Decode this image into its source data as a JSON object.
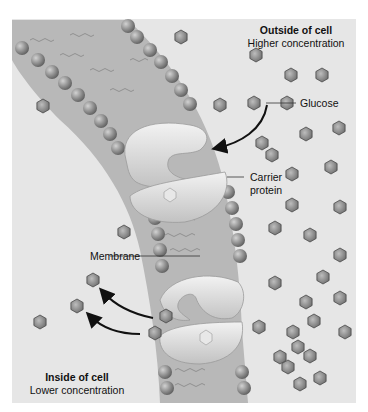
{
  "diagram": {
    "type": "facilitated-diffusion"
  },
  "regions": {
    "outside": {
      "title": "Outside of cell",
      "subtitle": "Higher concentration"
    },
    "inside": {
      "title": "Inside of cell",
      "subtitle": "Lower concentration"
    }
  },
  "labels": {
    "glucose": "Glucose",
    "carrier_protein_line1": "Carrier",
    "carrier_protein_line2": "protein",
    "membrane": "Membrane"
  },
  "colors": {
    "background": "#e6e6e6",
    "membrane_band": "#b8b8b8",
    "phospholipid_head": "#8a8a8a",
    "protein": "#d9d9d9",
    "glucose": "#7d7d7d",
    "arrow": "#111111"
  },
  "glucose_positions_outside": [
    [
      181,
      37
    ],
    [
      256,
      55
    ],
    [
      291,
      75
    ],
    [
      322,
      75
    ],
    [
      254,
      103
    ],
    [
      287,
      103
    ],
    [
      220,
      105
    ],
    [
      339,
      128
    ],
    [
      306,
      134
    ],
    [
      262,
      143
    ],
    [
      272,
      155
    ],
    [
      331,
      167
    ],
    [
      292,
      174
    ],
    [
      292,
      205
    ],
    [
      340,
      207
    ],
    [
      275,
      228
    ],
    [
      310,
      235
    ],
    [
      340,
      255
    ],
    [
      323,
      277
    ],
    [
      275,
      283
    ],
    [
      340,
      298
    ],
    [
      306,
      302
    ],
    [
      314,
      321
    ],
    [
      293,
      332
    ],
    [
      298,
      347
    ],
    [
      280,
      357
    ],
    [
      345,
      332
    ],
    [
      288,
      367
    ],
    [
      320,
      378
    ],
    [
      300,
      384
    ],
    [
      259,
      327
    ],
    [
      310,
      356
    ]
  ],
  "glucose_positions_inside": [
    [
      43,
      106
    ],
    [
      124,
      232
    ],
    [
      93,
      280
    ],
    [
      77,
      306
    ],
    [
      40,
      322
    ]
  ],
  "glucose_in_transit": [
    [
      166,
      316
    ],
    [
      155,
      333
    ]
  ]
}
